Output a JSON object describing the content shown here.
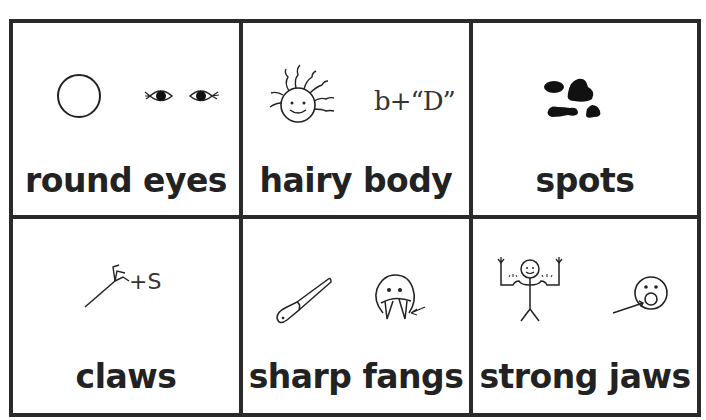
{
  "grid": {
    "rows": 2,
    "columns": 3,
    "border_color": "#2a2a2a",
    "cells": [
      {
        "label": "round eyes",
        "icons": [
          "circle-icon",
          "eyes-icon"
        ]
      },
      {
        "label": "hairy body",
        "icons": [
          "hairy-face-icon",
          "sign-notation-text"
        ],
        "notation": "b+“D”"
      },
      {
        "label": "spots",
        "icons": [
          "spots-icon"
        ]
      },
      {
        "label": "claws",
        "icons": [
          "claw-icon"
        ],
        "notation": "+S"
      },
      {
        "label": "sharp fangs",
        "icons": [
          "knife-icon",
          "fanged-face-icon"
        ]
      },
      {
        "label": "strong jaws",
        "icons": [
          "strong-person-icon",
          "jaw-face-icon"
        ]
      }
    ]
  }
}
